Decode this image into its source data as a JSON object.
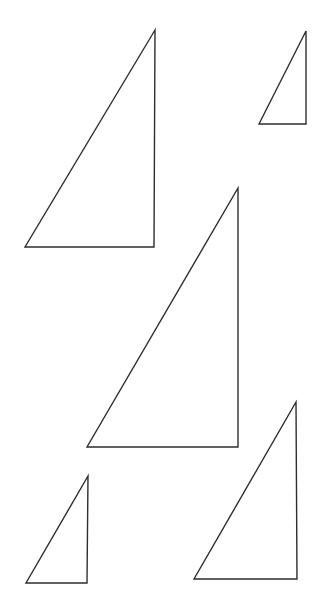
{
  "canvas": {
    "width": 321,
    "height": 611,
    "background_color": "#ffffff",
    "stroke_color": "#2e2e2e",
    "stroke_width": 1.4,
    "fill": "none"
  },
  "figure": {
    "type": "line-drawing",
    "shape_count": 5,
    "shape_kind": "right-triangle",
    "orientation": "right angle at bottom-right, hypotenuse from bottom-left up to top-right"
  },
  "shapes": [
    {
      "id": "triangle-1",
      "name": "large-upper-left-triangle",
      "size_rank": "large",
      "points": "155,30 25,247 154,247",
      "vertices": {
        "apex": [
          155,
          30
        ],
        "bottom_left": [
          25,
          247
        ],
        "bottom_right": [
          154,
          247
        ]
      },
      "bbox": [
        25,
        30,
        130,
        217
      ],
      "base_width": 129,
      "height": 217
    },
    {
      "id": "triangle-2",
      "name": "small-upper-right-triangle",
      "size_rank": "small",
      "points": "306,31 259,124 306,124",
      "vertices": {
        "apex": [
          306,
          31
        ],
        "bottom_left": [
          259,
          124
        ],
        "bottom_right": [
          306,
          124
        ]
      },
      "bbox": [
        259,
        31,
        47,
        93
      ],
      "base_width": 47,
      "height": 93
    },
    {
      "id": "triangle-3",
      "name": "largest-center-triangle",
      "size_rank": "largest",
      "points": "238,188 87,447 238,447",
      "vertices": {
        "apex": [
          238,
          188
        ],
        "bottom_left": [
          87,
          447
        ],
        "bottom_right": [
          238,
          447
        ]
      },
      "bbox": [
        87,
        188,
        151,
        259
      ],
      "base_width": 151,
      "height": 259
    },
    {
      "id": "triangle-4",
      "name": "small-lower-left-triangle",
      "size_rank": "small",
      "points": "88,476 26,583 87,583",
      "vertices": {
        "apex": [
          88,
          476
        ],
        "bottom_left": [
          26,
          583
        ],
        "bottom_right": [
          87,
          583
        ]
      },
      "bbox": [
        26,
        476,
        62,
        107
      ],
      "base_width": 61,
      "height": 107
    },
    {
      "id": "triangle-5",
      "name": "medium-lower-right-triangle",
      "size_rank": "medium",
      "points": "296,402 194,579 297,579",
      "vertices": {
        "apex": [
          296,
          402
        ],
        "bottom_left": [
          194,
          579
        ],
        "bottom_right": [
          297,
          579
        ]
      },
      "bbox": [
        194,
        402,
        103,
        177
      ],
      "base_width": 103,
      "height": 177
    }
  ]
}
